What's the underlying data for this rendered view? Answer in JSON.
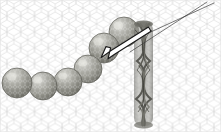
{
  "figure": {
    "width": 221,
    "height": 132,
    "background_color": "#ffffff"
  },
  "substrate": {
    "name": "graphene-hexagonal-lattice",
    "line_color": "#d2d2d2",
    "line_width": 0.5,
    "hex_radius": 4.6,
    "description": "honeycomb carbon sheet filling entire frame"
  },
  "sphere_chain": {
    "name": "nanoparticle-chain",
    "count": 6,
    "fill_color": "#9b9b96",
    "edge_color": "#6e6e68",
    "highlight_color": "#d8d8d2",
    "spheres": [
      {
        "cx": 17,
        "cy": 83,
        "r": 15
      },
      {
        "cx": 43,
        "cy": 86,
        "r": 14
      },
      {
        "cx": 68,
        "cy": 82,
        "r": 14
      },
      {
        "cx": 88,
        "cy": 69,
        "r": 14
      },
      {
        "cx": 104,
        "cy": 48,
        "r": 15
      },
      {
        "cx": 124,
        "cy": 32,
        "r": 15
      }
    ]
  },
  "nanotube": {
    "name": "vertical-twisted-nanotube",
    "cx": 143,
    "top": 22,
    "bottom": 126,
    "width": 20,
    "fill_color": "#8d8d88",
    "stroke_color": "#4a4a46",
    "strand_count": 4,
    "description": "helically twisted bundle running top to bottom"
  },
  "guide_lines": {
    "name": "diagonal-guide-lines",
    "color": "#3c3c3c",
    "width": 0.7,
    "lines": [
      {
        "x1": 118,
        "y1": 47,
        "x2": 214,
        "y2": 3
      },
      {
        "x1": 130,
        "y1": 52,
        "x2": 207,
        "y2": 2
      }
    ]
  },
  "arrow": {
    "name": "white-annotation-arrow",
    "fill_color": "#ffffff",
    "outline_color": "#1a1a1a",
    "tip_x": 101,
    "tip_y": 57,
    "tail_x": 148,
    "tail_y": 29,
    "direction": "points down-left toward nanoparticle chain"
  }
}
